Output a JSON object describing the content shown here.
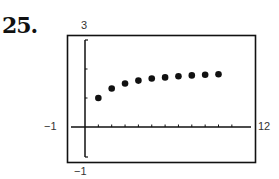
{
  "problem_number": "25.",
  "window": {
    "xmin_label": "−1",
    "xmax_label": "12",
    "ymin_label": "−1",
    "ymax_label": "3"
  },
  "chart_data": {
    "type": "scatter",
    "title": "25.",
    "xlabel": "",
    "ylabel": "",
    "xlim": [
      -1,
      12
    ],
    "ylim": [
      -1,
      3
    ],
    "grid": false,
    "x_tick_step": 1,
    "y_tick_step": 1,
    "series": [
      {
        "name": "sequence",
        "x": [
          1,
          2,
          3,
          4,
          5,
          6,
          7,
          8,
          9,
          10
        ],
        "y": [
          1.0,
          1.33,
          1.5,
          1.6,
          1.67,
          1.71,
          1.75,
          1.78,
          1.8,
          1.82
        ]
      }
    ]
  },
  "colors": {
    "ink": "#111111",
    "background": "#ffffff"
  }
}
